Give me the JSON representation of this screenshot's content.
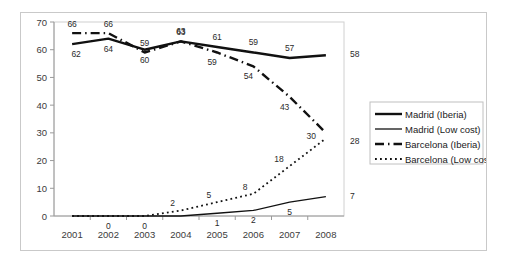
{
  "chart_data": {
    "type": "line",
    "title": "",
    "xlabel": "",
    "ylabel": "",
    "categories": [
      "2001",
      "2002",
      "2003",
      "2004",
      "2005",
      "2006",
      "2007",
      "2008"
    ],
    "ylim": [
      0,
      70
    ],
    "yticks": [
      "0",
      "10",
      "20",
      "30",
      "40",
      "50",
      "60",
      "70"
    ],
    "grid": false,
    "legend_position": "right",
    "series": [
      {
        "name": "Madrid (Iberia)",
        "style": "solid-thick",
        "values": [
          62,
          64,
          60,
          63,
          61,
          59,
          57,
          58
        ],
        "labels": [
          "62",
          "64",
          "60",
          "63",
          "61",
          "59",
          "57",
          "58"
        ]
      },
      {
        "name": "Madrid (Low cost)",
        "style": "solid-thin",
        "values": [
          0,
          0,
          0,
          0,
          1,
          2,
          5,
          7
        ],
        "labels": [
          "",
          "0",
          "0",
          "",
          "1",
          "2",
          "5",
          "7"
        ]
      },
      {
        "name": "Barcelona (Iberia)",
        "style": "dash-dot",
        "values": [
          66,
          66,
          59,
          63,
          59,
          54,
          43,
          30
        ],
        "labels": [
          "66",
          "66",
          "59",
          "63",
          "59",
          "54",
          "43",
          "30"
        ]
      },
      {
        "name": "Barcelona (Low cost)",
        "style": "dotted",
        "values": [
          0,
          0,
          0,
          2,
          5,
          8,
          18,
          28
        ],
        "labels": [
          "",
          "",
          "",
          "2",
          "5",
          "8",
          "18",
          "28"
        ]
      }
    ]
  },
  "legend": {
    "entries": [
      {
        "label": "Madrid (Iberia)"
      },
      {
        "label": "Madrid (Low cost)"
      },
      {
        "label": "Barcelona (Iberia)"
      },
      {
        "label": "Barcelona (Low cost)"
      }
    ]
  },
  "colors": {
    "line": "#111111",
    "axis": "#9a9a9a",
    "frame": "#c9c9c9",
    "text": "#3b3b3b"
  }
}
